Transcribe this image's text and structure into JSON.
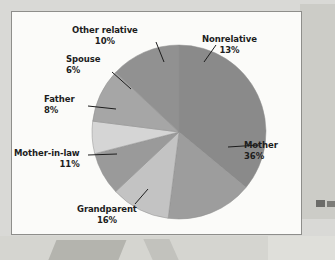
{
  "panel": {
    "background_color": "#fbfbf9",
    "border_color": "#8e8e8b"
  },
  "chart_data": {
    "type": "pie",
    "title": "",
    "subtitle": "",
    "xlabel": "",
    "ylabel": "",
    "grid": false,
    "legend_position": "none",
    "label_format": "name + percent, outside with leader lines",
    "start_angle_deg": 0,
    "direction": "clockwise",
    "categories": [
      "Mother",
      "Grandparent",
      "Mother-in-law",
      "Father",
      "Spouse",
      "Other relative",
      "Nonrelative"
    ],
    "values": [
      36,
      16,
      11,
      8,
      6,
      10,
      13
    ],
    "value_unit": "%",
    "total": 100,
    "slices": [
      {
        "name": "Mother",
        "value": 36,
        "percent_text": "36%",
        "color": "#8a8a8a",
        "label": "Mother",
        "label_align": "left"
      },
      {
        "name": "Grandparent",
        "value": 16,
        "percent_text": "16%",
        "color": "#9d9d9d",
        "label": "Grandparent",
        "label_align": "center"
      },
      {
        "name": "Mother-in-law",
        "value": 11,
        "percent_text": "11%",
        "color": "#c3c3c3",
        "label": "Mother-in-law",
        "label_align": "right"
      },
      {
        "name": "Father",
        "value": 8,
        "percent_text": "8%",
        "color": "#9a9a9a",
        "label": "Father",
        "label_align": "right"
      },
      {
        "name": "Spouse",
        "value": 6,
        "percent_text": "6%",
        "color": "#d5d5d5",
        "label": "Spouse",
        "label_align": "right"
      },
      {
        "name": "Other relative",
        "value": 10,
        "percent_text": "10%",
        "color": "#a6a6a6",
        "label": "Other relative",
        "label_align": "center"
      },
      {
        "name": "Nonrelative",
        "value": 13,
        "percent_text": "13%",
        "color": "#919191",
        "label": "Nonrelative",
        "label_align": "center"
      }
    ]
  }
}
